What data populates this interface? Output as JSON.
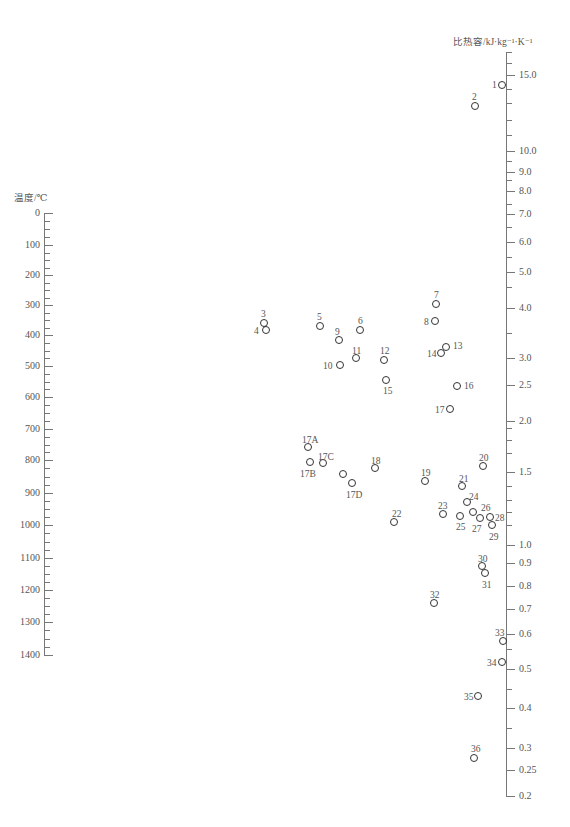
{
  "chart_data": {
    "type": "nomogram",
    "title": "",
    "left_axis": {
      "label": "温度/℃",
      "ticks": [
        0,
        100,
        200,
        300,
        400,
        500,
        600,
        700,
        800,
        900,
        1000,
        1100,
        1200,
        1300,
        1400
      ],
      "tick_y": [
        213,
        245,
        275,
        305,
        335,
        366,
        397,
        429,
        460,
        493,
        525,
        558,
        590,
        622,
        655
      ],
      "x": 44
    },
    "right_axis": {
      "label": "比热容/kJ·kg⁻¹·K⁻¹",
      "ticks": [
        "15.0",
        "10.0",
        "9.0",
        "8.0",
        "7.0",
        "6.0",
        "5.0",
        "4.0",
        "3.0",
        "2.5",
        "2.0",
        "1.5",
        "1.0",
        "0.9",
        "0.8",
        "0.7",
        "0.6",
        "0.5",
        "0.4",
        "0.3",
        "0.25",
        "0.2"
      ],
      "tick_y": [
        75,
        151,
        172,
        191,
        214,
        242,
        272,
        308,
        358,
        385,
        421,
        472,
        545,
        563,
        586,
        609,
        634,
        669,
        708,
        748,
        770,
        796
      ],
      "minor_tick_y": [
        52,
        63,
        89,
        103,
        120,
        135,
        161,
        180,
        204,
        227,
        257,
        287,
        333,
        428,
        440,
        453,
        486,
        500,
        512,
        525,
        649,
        689,
        728
      ],
      "x": 506
    },
    "points": [
      {
        "id": "1",
        "x": 502,
        "y": 85,
        "lx": 492,
        "ly": 80
      },
      {
        "id": "2",
        "x": 475,
        "y": 106,
        "lx": 472,
        "ly": 92
      },
      {
        "id": "3",
        "x": 264,
        "y": 323,
        "lx": 261,
        "ly": 309
      },
      {
        "id": "4",
        "x": 266,
        "y": 330,
        "lx": 254,
        "ly": 326
      },
      {
        "id": "5",
        "x": 320,
        "y": 326,
        "lx": 317,
        "ly": 312
      },
      {
        "id": "6",
        "x": 360,
        "y": 330,
        "lx": 358,
        "ly": 316
      },
      {
        "id": "7",
        "x": 436,
        "y": 304,
        "lx": 434,
        "ly": 290
      },
      {
        "id": "8",
        "x": 435,
        "y": 321,
        "lx": 424,
        "ly": 317
      },
      {
        "id": "9",
        "x": 339,
        "y": 340,
        "lx": 335,
        "ly": 327
      },
      {
        "id": "10",
        "x": 340,
        "y": 365,
        "lx": 323,
        "ly": 361
      },
      {
        "id": "11",
        "x": 356,
        "y": 358,
        "lx": 352,
        "ly": 346
      },
      {
        "id": "12",
        "x": 384,
        "y": 360,
        "lx": 380,
        "ly": 346
      },
      {
        "id": "13",
        "x": 446,
        "y": 347,
        "lx": 453,
        "ly": 341
      },
      {
        "id": "14",
        "x": 441,
        "y": 353,
        "lx": 427,
        "ly": 349
      },
      {
        "id": "15",
        "x": 386,
        "y": 380,
        "lx": 383,
        "ly": 386
      },
      {
        "id": "16",
        "x": 457,
        "y": 386,
        "lx": 464,
        "ly": 381
      },
      {
        "id": "17",
        "x": 450,
        "y": 409,
        "lx": 435,
        "ly": 405
      },
      {
        "id": "17A",
        "x": 308,
        "y": 447,
        "lx": 302,
        "ly": 435
      },
      {
        "id": "17B",
        "x": 310,
        "y": 462,
        "lx": 300,
        "ly": 469
      },
      {
        "id": "17C",
        "x": 323,
        "y": 463,
        "lx": 318,
        "ly": 452
      },
      {
        "id": "",
        "x": 343,
        "y": 474,
        "lx": 0,
        "ly": 0
      },
      {
        "id": "17D",
        "x": 352,
        "y": 483,
        "lx": 346,
        "ly": 490
      },
      {
        "id": "18",
        "x": 375,
        "y": 468,
        "lx": 371,
        "ly": 456
      },
      {
        "id": "19",
        "x": 425,
        "y": 481,
        "lx": 421,
        "ly": 468
      },
      {
        "id": "20",
        "x": 483,
        "y": 466,
        "lx": 479,
        "ly": 453
      },
      {
        "id": "21",
        "x": 462,
        "y": 486,
        "lx": 459,
        "ly": 474
      },
      {
        "id": "22",
        "x": 394,
        "y": 522,
        "lx": 392,
        "ly": 509
      },
      {
        "id": "23",
        "x": 443,
        "y": 514,
        "lx": 438,
        "ly": 501
      },
      {
        "id": "24",
        "x": 467,
        "y": 502,
        "lx": 469,
        "ly": 492
      },
      {
        "id": "25",
        "x": 460,
        "y": 516,
        "lx": 456,
        "ly": 522
      },
      {
        "id": "26",
        "x": 473,
        "y": 512,
        "lx": 481,
        "ly": 503
      },
      {
        "id": "27",
        "x": 480,
        "y": 518,
        "lx": 472,
        "ly": 524
      },
      {
        "id": "28",
        "x": 490,
        "y": 517,
        "lx": 495,
        "ly": 513
      },
      {
        "id": "29",
        "x": 492,
        "y": 525,
        "lx": 489,
        "ly": 532
      },
      {
        "id": "30",
        "x": 482,
        "y": 566,
        "lx": 478,
        "ly": 554
      },
      {
        "id": "31",
        "x": 485,
        "y": 573,
        "lx": 482,
        "ly": 580
      },
      {
        "id": "32",
        "x": 434,
        "y": 603,
        "lx": 430,
        "ly": 590
      },
      {
        "id": "33",
        "x": 503,
        "y": 641,
        "lx": 495,
        "ly": 628
      },
      {
        "id": "34",
        "x": 502,
        "y": 662,
        "lx": 487,
        "ly": 658
      },
      {
        "id": "35",
        "x": 478,
        "y": 696,
        "lx": 464,
        "ly": 692
      },
      {
        "id": "36",
        "x": 474,
        "y": 758,
        "lx": 471,
        "ly": 744
      }
    ]
  }
}
